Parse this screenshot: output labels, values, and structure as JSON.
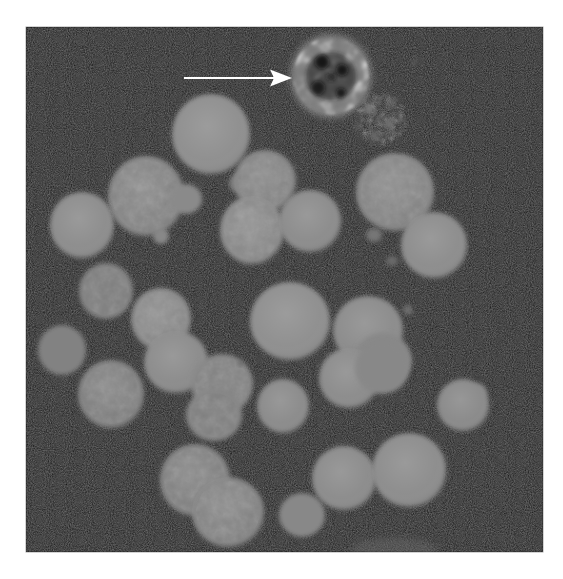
{
  "figure": {
    "kind": "micrograph",
    "modality": "fluorescence-microscopy",
    "caption_visible": "",
    "background_color": "#ffffff",
    "field_color": "#080808",
    "cell_color": "#8a8a8a",
    "annotation_color": "#ffffff"
  },
  "field": {
    "x": 26,
    "y": 27,
    "width": 517,
    "height": 525,
    "label": "imaging-field"
  },
  "annotations": [
    {
      "type": "arrow",
      "name": "pointer-arrow",
      "color": "#ffffff",
      "x1": 184,
      "y1": 78,
      "x2": 292,
      "y2": 78,
      "head_length": 22,
      "head_width": 17,
      "shaft_width": 2.2,
      "points_to": "apoptotic-cell"
    }
  ],
  "cells": [
    {
      "name": "apoptotic-cell",
      "cx": 331,
      "cy": 76,
      "rx": 41,
      "ry": 42,
      "fill": "#6f6f6f",
      "texture": "vacuolated",
      "highlighted": true
    },
    {
      "name": "debris-cluster",
      "cx": 381,
      "cy": 119,
      "rx": 26,
      "ry": 27,
      "fill": "#5c5c5c",
      "texture": "fragmented",
      "highlighted": false
    },
    {
      "name": "cell-a1",
      "cx": 211,
      "cy": 134,
      "rx": 39,
      "ry": 40,
      "fill": "#8d8d8d",
      "texture": "smooth",
      "highlighted": false
    },
    {
      "name": "cell-a2",
      "cx": 146,
      "cy": 196,
      "rx": 38,
      "ry": 40,
      "fill": "#868686",
      "texture": "mottled",
      "highlighted": false
    },
    {
      "name": "cell-a3",
      "cx": 82,
      "cy": 225,
      "rx": 32,
      "ry": 33,
      "fill": "#8b8b8b",
      "texture": "smooth",
      "highlighted": false
    },
    {
      "name": "cell-a4",
      "cx": 186,
      "cy": 199,
      "rx": 16,
      "ry": 15,
      "fill": "#8a8a8a",
      "texture": "smooth",
      "highlighted": false
    },
    {
      "name": "cell-a5",
      "cx": 161,
      "cy": 236,
      "rx": 8,
      "ry": 8,
      "fill": "#888888",
      "texture": "smooth",
      "highlighted": false
    },
    {
      "name": "cell-a6",
      "cx": 240,
      "cy": 183,
      "rx": 11,
      "ry": 10,
      "fill": "#7e7e7e",
      "texture": "smooth",
      "highlighted": false
    },
    {
      "name": "cell-a7",
      "cx": 249,
      "cy": 179,
      "rx": 7,
      "ry": 7,
      "fill": "#808080",
      "texture": "smooth",
      "highlighted": false
    },
    {
      "name": "cell-b1",
      "cx": 265,
      "cy": 181,
      "rx": 31,
      "ry": 31,
      "fill": "#868686",
      "texture": "mottled",
      "highlighted": false
    },
    {
      "name": "cell-b2",
      "cx": 252,
      "cy": 230,
      "rx": 32,
      "ry": 34,
      "fill": "#8c8c8c",
      "texture": "mottled",
      "highlighted": false
    },
    {
      "name": "cell-b3",
      "cx": 310,
      "cy": 221,
      "rx": 31,
      "ry": 31,
      "fill": "#8a8a8a",
      "texture": "smooth",
      "highlighted": false
    },
    {
      "name": "cell-b4",
      "cx": 395,
      "cy": 192,
      "rx": 39,
      "ry": 39,
      "fill": "#878787",
      "texture": "mottled",
      "highlighted": false
    },
    {
      "name": "cell-b5",
      "cx": 434,
      "cy": 245,
      "rx": 33,
      "ry": 33,
      "fill": "#8b8b8b",
      "texture": "smooth",
      "highlighted": false
    },
    {
      "name": "cell-b6",
      "cx": 374,
      "cy": 235,
      "rx": 8,
      "ry": 7,
      "fill": "#767676",
      "texture": "smooth",
      "highlighted": false
    },
    {
      "name": "cell-c1",
      "cx": 106,
      "cy": 291,
      "rx": 27,
      "ry": 28,
      "fill": "#858585",
      "texture": "mottled",
      "highlighted": false
    },
    {
      "name": "cell-c2",
      "cx": 161,
      "cy": 319,
      "rx": 30,
      "ry": 31,
      "fill": "#8b8b8b",
      "texture": "mottled",
      "highlighted": false
    },
    {
      "name": "cell-c3",
      "cx": 176,
      "cy": 362,
      "rx": 32,
      "ry": 31,
      "fill": "#8a8a8a",
      "texture": "smooth",
      "highlighted": false
    },
    {
      "name": "cell-c4",
      "cx": 290,
      "cy": 321,
      "rx": 40,
      "ry": 39,
      "fill": "#8d8d8d",
      "texture": "smooth",
      "highlighted": false
    },
    {
      "name": "cell-c5",
      "cx": 62,
      "cy": 350,
      "rx": 24,
      "ry": 25,
      "fill": "#828282",
      "texture": "smooth",
      "highlighted": false
    },
    {
      "name": "cell-c6",
      "cx": 368,
      "cy": 330,
      "rx": 35,
      "ry": 34,
      "fill": "#8a8a8a",
      "texture": "smooth",
      "highlighted": false
    },
    {
      "name": "cell-c7",
      "cx": 383,
      "cy": 360,
      "rx": 29,
      "ry": 27,
      "fill": "#888888",
      "texture": "smooth",
      "highlighted": false
    },
    {
      "name": "cell-d1",
      "cx": 111,
      "cy": 394,
      "rx": 33,
      "ry": 34,
      "fill": "#828282",
      "texture": "mottled",
      "highlighted": false
    },
    {
      "name": "cell-d2",
      "cx": 222,
      "cy": 384,
      "rx": 31,
      "ry": 30,
      "fill": "#898989",
      "texture": "bumpy",
      "highlighted": false
    },
    {
      "name": "cell-d3",
      "cx": 214,
      "cy": 415,
      "rx": 28,
      "ry": 26,
      "fill": "#878787",
      "texture": "bumpy",
      "highlighted": false
    },
    {
      "name": "cell-d4",
      "cx": 283,
      "cy": 406,
      "rx": 26,
      "ry": 27,
      "fill": "#898989",
      "texture": "smooth",
      "highlighted": false
    },
    {
      "name": "cell-d5",
      "cx": 349,
      "cy": 378,
      "rx": 30,
      "ry": 30,
      "fill": "#8a8a8a",
      "texture": "smooth",
      "highlighted": false
    },
    {
      "name": "cell-d6",
      "cx": 382,
      "cy": 368,
      "rx": 27,
      "ry": 26,
      "fill": "#888888",
      "texture": "smooth",
      "highlighted": false
    },
    {
      "name": "cell-d7",
      "cx": 478,
      "cy": 392,
      "rx": 9,
      "ry": 8,
      "fill": "#7d7d7d",
      "texture": "smooth",
      "highlighted": false
    },
    {
      "name": "cell-d8",
      "cx": 463,
      "cy": 405,
      "rx": 26,
      "ry": 26,
      "fill": "#888888",
      "texture": "smooth",
      "highlighted": false
    },
    {
      "name": "cell-e1",
      "cx": 195,
      "cy": 480,
      "rx": 35,
      "ry": 36,
      "fill": "#838383",
      "texture": "mottled",
      "highlighted": false
    },
    {
      "name": "cell-e2",
      "cx": 228,
      "cy": 512,
      "rx": 36,
      "ry": 35,
      "fill": "#858585",
      "texture": "mottled",
      "highlighted": false
    },
    {
      "name": "cell-e3",
      "cx": 302,
      "cy": 515,
      "rx": 23,
      "ry": 22,
      "fill": "#888888",
      "texture": "smooth",
      "highlighted": false
    },
    {
      "name": "cell-e4",
      "cx": 337,
      "cy": 495,
      "rx": 8,
      "ry": 8,
      "fill": "#848484",
      "texture": "smooth",
      "highlighted": false
    },
    {
      "name": "cell-e5",
      "cx": 344,
      "cy": 478,
      "rx": 32,
      "ry": 32,
      "fill": "#8a8a8a",
      "texture": "smooth",
      "highlighted": false
    },
    {
      "name": "cell-e6",
      "cx": 409,
      "cy": 470,
      "rx": 37,
      "ry": 37,
      "fill": "#8b8b8b",
      "texture": "smooth",
      "highlighted": false
    },
    {
      "name": "cell-f1",
      "cx": 408,
      "cy": 310,
      "rx": 5,
      "ry": 5,
      "fill": "#6e6e6e",
      "texture": "smooth",
      "highlighted": false
    },
    {
      "name": "cell-f2",
      "cx": 392,
      "cy": 261,
      "rx": 6,
      "ry": 5,
      "fill": "#6a6a6a",
      "texture": "smooth",
      "highlighted": false
    }
  ],
  "counts": {
    "total_cells_visible": 38,
    "arrows": 1
  }
}
